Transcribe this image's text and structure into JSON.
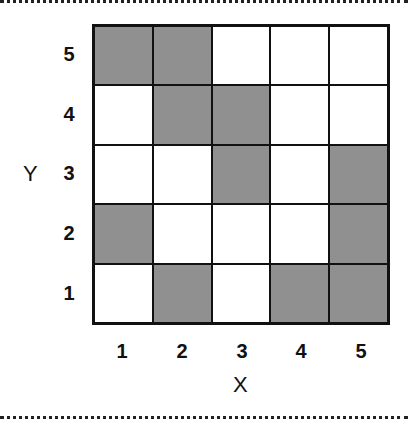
{
  "chart_data": {
    "type": "heatmap",
    "title": "",
    "xlabel": "X",
    "ylabel": "Y",
    "x_ticks": [
      "1",
      "2",
      "3",
      "4",
      "5"
    ],
    "y_ticks": [
      "5",
      "4",
      "3",
      "2",
      "1"
    ],
    "rows_top_to_bottom": [
      {
        "y": 5,
        "shaded": [
          1,
          1,
          0,
          0,
          0
        ]
      },
      {
        "y": 4,
        "shaded": [
          0,
          1,
          1,
          0,
          0
        ]
      },
      {
        "y": 3,
        "shaded": [
          0,
          0,
          1,
          0,
          1
        ]
      },
      {
        "y": 2,
        "shaded": [
          1,
          0,
          0,
          0,
          1
        ]
      },
      {
        "y": 1,
        "shaded": [
          0,
          1,
          0,
          1,
          1
        ]
      }
    ],
    "shaded_color": "#909090",
    "empty_color": "#ffffff"
  },
  "labels": {
    "x_axis": "X",
    "y_axis": "Y",
    "x1": "1",
    "x2": "2",
    "x3": "3",
    "x4": "4",
    "x5": "5",
    "y1": "1",
    "y2": "2",
    "y3": "3",
    "y4": "4",
    "y5": "5"
  }
}
